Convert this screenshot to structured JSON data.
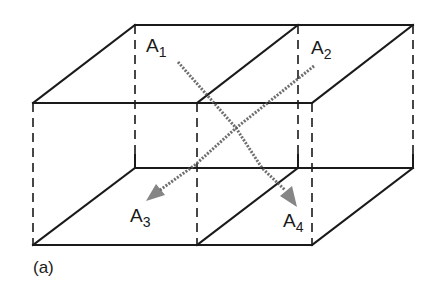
{
  "figure": {
    "caption": "(a)",
    "labels": [
      {
        "id": "A1",
        "main": "A",
        "sub": "1"
      },
      {
        "id": "A2",
        "main": "A",
        "sub": "2"
      },
      {
        "id": "A3",
        "main": "A",
        "sub": "3"
      },
      {
        "id": "A4",
        "main": "A",
        "sub": "4"
      }
    ]
  }
}
